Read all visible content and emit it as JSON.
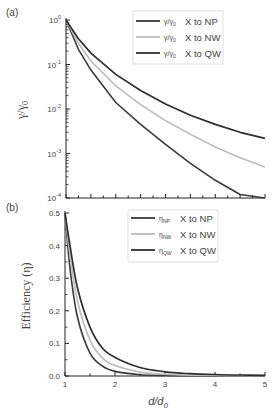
{
  "panels": [
    {
      "label": "(a)"
    },
    {
      "label": "(b)"
    }
  ],
  "chart_data": [
    {
      "type": "line",
      "panel": "(a)",
      "title": "",
      "xlabel": "",
      "ylabel": "γ/γ0",
      "yscale": "log",
      "xlim": [
        1,
        5
      ],
      "ylim": [
        0.0001,
        1
      ],
      "ytick_labels": [
        "10^0",
        "10^-1",
        "10^-2",
        "10^-3",
        "10^-4"
      ],
      "yticks": [
        1,
        0.1,
        0.01,
        0.001,
        0.0001
      ],
      "xtick_labels": [],
      "grid": false,
      "legend_position": "upper right",
      "x": [
        1.0,
        1.25,
        1.5,
        2.0,
        2.5,
        3.0,
        3.5,
        4.0,
        4.5,
        5.0
      ],
      "series": [
        {
          "name": "γ/γ0 X to NP",
          "color": "#3a3a3a",
          "values": [
            1.0,
            0.22,
            0.075,
            0.014,
            0.0045,
            0.0016,
            0.0006,
            0.00025,
            0.00012,
            6e-05
          ]
        },
        {
          "name": "γ/γ0 X to NW",
          "color": "#bdbdbd",
          "values": [
            1.0,
            0.3,
            0.12,
            0.033,
            0.0125,
            0.0055,
            0.0027,
            0.0014,
            0.0008,
            0.0005
          ]
        },
        {
          "name": "γ/γ0 X to QW",
          "color": "#2e2e2e",
          "values": [
            1.0,
            0.38,
            0.18,
            0.06,
            0.026,
            0.013,
            0.0072,
            0.0045,
            0.003,
            0.0022
          ]
        }
      ]
    },
    {
      "type": "line",
      "panel": "(b)",
      "title": "",
      "xlabel": "d/d0",
      "ylabel": "Efficiency (η)",
      "xlim": [
        1,
        5
      ],
      "ylim": [
        0.0,
        0.5
      ],
      "xticks": [
        1,
        2,
        3,
        4,
        5
      ],
      "xtick_labels": [
        "1",
        "2",
        "3",
        "4",
        "5"
      ],
      "yticks": [
        0.0,
        0.1,
        0.2,
        0.3,
        0.4,
        0.5
      ],
      "ytick_labels": [
        "0.0",
        "0.1",
        "0.2",
        "0.3",
        "0.4",
        "0.5"
      ],
      "grid": false,
      "legend_position": "upper right",
      "x": [
        1.0,
        1.1,
        1.25,
        1.5,
        1.75,
        2.0,
        2.5,
        3.0,
        3.5,
        4.0,
        4.5,
        5.0
      ],
      "series": [
        {
          "name": "ηNP X to NP",
          "color": "#3a3a3a",
          "values": [
            0.5,
            0.33,
            0.18,
            0.07,
            0.03,
            0.014,
            0.004,
            0.0015,
            0.0006,
            0.0002,
            0.0001,
            0.0
          ]
        },
        {
          "name": "ηNW X to NW",
          "color": "#bdbdbd",
          "values": [
            0.5,
            0.37,
            0.23,
            0.11,
            0.055,
            0.032,
            0.012,
            0.0055,
            0.0027,
            0.0014,
            0.0008,
            0.0005
          ]
        },
        {
          "name": "ηQW X to QW",
          "color": "#2e2e2e",
          "values": [
            0.5,
            0.4,
            0.27,
            0.15,
            0.085,
            0.057,
            0.026,
            0.013,
            0.0072,
            0.0045,
            0.003,
            0.0022
          ]
        }
      ]
    }
  ],
  "legends": {
    "a": [
      {
        "sym": "γ/γ",
        "sub": "0",
        "label": "X to NP"
      },
      {
        "sym": "γ/γ",
        "sub": "0",
        "label": "X to NW"
      },
      {
        "sym": "γ/γ",
        "sub": "0",
        "label": "X to QW"
      }
    ],
    "b": [
      {
        "sym": "η",
        "sub": "NP",
        "label": "X to NP"
      },
      {
        "sym": "η",
        "sub": "NW",
        "label": "X to NW"
      },
      {
        "sym": "η",
        "sub": "QW",
        "label": "X to QW"
      }
    ]
  },
  "axis_labels": {
    "a_ylabel_main": "γ/γ",
    "a_ylabel_sub": "0",
    "b_ylabel": "Efficiency (η)",
    "b_xlabel_main": "d/d",
    "b_xlabel_sub": "0"
  }
}
